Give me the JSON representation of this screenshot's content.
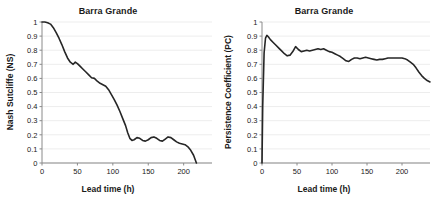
{
  "figure": {
    "panels": [
      {
        "id": "left",
        "title": "Barra Grande",
        "xlabel": "Lead time (h)",
        "ylabel": "Nash Sutcliffe (NS)"
      },
      {
        "id": "right",
        "title": "Barra Grande",
        "xlabel": "Lead time (h)",
        "ylabel": "Persistence Coefficient (PC)"
      }
    ],
    "line_color": "#262626",
    "grid_color": "#ededed",
    "axis_color": "#8a8a8a"
  },
  "chart_data": [
    {
      "type": "line",
      "title": "Barra Grande",
      "xlabel": "Lead time (h)",
      "ylabel": "Nash Sutcliffe (NS)",
      "xlim": [
        0,
        240
      ],
      "ylim": [
        0,
        1
      ],
      "xticks": [
        0,
        50,
        100,
        150,
        200
      ],
      "yticks": [
        0,
        0.1,
        0.2,
        0.3,
        0.4,
        0.5,
        0.6,
        0.7,
        0.8,
        0.9,
        1
      ],
      "xticklabels": [
        "0",
        "50",
        "100",
        "150",
        "200"
      ],
      "yticklabels": [
        "0",
        "0.1",
        "0.2",
        "0.3",
        "0.4",
        "0.5",
        "0.6",
        "0.7",
        "0.8",
        "0.9",
        "1"
      ],
      "grid": "horizontal",
      "legend": "none",
      "series": [
        {
          "name": "Nash Sutcliffe (NS)",
          "x": [
            0,
            4,
            8,
            12,
            16,
            20,
            24,
            28,
            32,
            36,
            40,
            44,
            47,
            50,
            54,
            58,
            62,
            66,
            70,
            74,
            78,
            82,
            86,
            90,
            94,
            98,
            102,
            106,
            110,
            114,
            118,
            121,
            124,
            127,
            130,
            134,
            138,
            142,
            146,
            150,
            154,
            158,
            162,
            166,
            170,
            174,
            178,
            182,
            186,
            190,
            194,
            198,
            202,
            206,
            210,
            214,
            218
          ],
          "y": [
            1.0,
            1.0,
            0.995,
            0.985,
            0.96,
            0.925,
            0.885,
            0.84,
            0.79,
            0.745,
            0.715,
            0.7,
            0.715,
            0.705,
            0.685,
            0.665,
            0.645,
            0.625,
            0.605,
            0.6,
            0.58,
            0.565,
            0.555,
            0.545,
            0.52,
            0.485,
            0.45,
            0.41,
            0.365,
            0.315,
            0.265,
            0.215,
            0.175,
            0.16,
            0.165,
            0.18,
            0.175,
            0.16,
            0.155,
            0.165,
            0.18,
            0.185,
            0.175,
            0.16,
            0.155,
            0.17,
            0.185,
            0.18,
            0.165,
            0.15,
            0.14,
            0.135,
            0.13,
            0.115,
            0.09,
            0.055,
            0.0
          ]
        }
      ]
    },
    {
      "type": "line",
      "title": "Barra Grande",
      "xlabel": "Lead time (h)",
      "ylabel": "Persistence Coefficient (PC)",
      "xlim": [
        0,
        240
      ],
      "ylim": [
        0,
        1
      ],
      "xticks": [
        0,
        50,
        100,
        150,
        200
      ],
      "yticks": [
        0,
        0.1,
        0.2,
        0.3,
        0.4,
        0.5,
        0.6,
        0.7,
        0.8,
        0.9,
        1
      ],
      "xticklabels": [
        "0",
        "50",
        "100",
        "150",
        "200"
      ],
      "yticklabels": [
        "0",
        "0.1",
        "0.2",
        "0.3",
        "0.4",
        "0.5",
        "0.6",
        "0.7",
        "0.8",
        "0.9",
        "1"
      ],
      "grid": "horizontal",
      "legend": "none",
      "series": [
        {
          "name": "Persistence Coefficient (PC)",
          "x": [
            0,
            1,
            3,
            5,
            7,
            9,
            12,
            16,
            20,
            24,
            28,
            32,
            36,
            40,
            44,
            48,
            52,
            56,
            60,
            64,
            68,
            72,
            76,
            80,
            84,
            88,
            92,
            96,
            100,
            104,
            108,
            112,
            116,
            120,
            124,
            128,
            132,
            136,
            140,
            144,
            148,
            152,
            156,
            160,
            164,
            168,
            172,
            176,
            180,
            184,
            188,
            192,
            196,
            200,
            204,
            208,
            212,
            216,
            220,
            224,
            228,
            232,
            236,
            240
          ],
          "y": [
            0.0,
            0.4,
            0.78,
            0.885,
            0.905,
            0.895,
            0.875,
            0.855,
            0.835,
            0.815,
            0.795,
            0.775,
            0.76,
            0.765,
            0.79,
            0.825,
            0.805,
            0.79,
            0.795,
            0.8,
            0.795,
            0.8,
            0.805,
            0.81,
            0.805,
            0.81,
            0.8,
            0.79,
            0.785,
            0.775,
            0.765,
            0.755,
            0.74,
            0.725,
            0.72,
            0.735,
            0.745,
            0.745,
            0.74,
            0.745,
            0.75,
            0.745,
            0.74,
            0.735,
            0.73,
            0.735,
            0.735,
            0.74,
            0.745,
            0.745,
            0.745,
            0.745,
            0.745,
            0.745,
            0.74,
            0.73,
            0.715,
            0.7,
            0.675,
            0.645,
            0.62,
            0.6,
            0.585,
            0.575
          ]
        }
      ]
    }
  ]
}
